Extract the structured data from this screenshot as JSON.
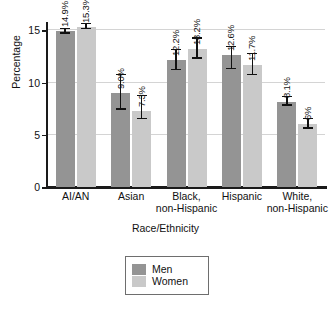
{
  "chart_data": {
    "type": "bar",
    "title": "",
    "xlabel": "Race/Ethnicity",
    "ylabel": "Percentage",
    "ylim": [
      0,
      15.8
    ],
    "yticks": [
      0,
      5,
      10,
      15
    ],
    "ytick_labels": [
      "0",
      "5",
      "10",
      "15"
    ],
    "grid": true,
    "grid_values": [
      5,
      10,
      15
    ],
    "legend_position": "bottom-center",
    "categories": [
      "AI/AN",
      "Asian",
      "Black, non-Hispanic",
      "Hispanic",
      "White, non-Hispanic"
    ],
    "category_lines": [
      [
        "AI/AN"
      ],
      [
        "Asian"
      ],
      [
        "Black,",
        "non-Hispanic"
      ],
      [
        "Hispanic"
      ],
      [
        "White,",
        "non-Hispanic"
      ]
    ],
    "series": [
      {
        "name": "Men",
        "color": "#949494",
        "values": [
          14.9,
          9.0,
          12.2,
          12.6,
          8.1
        ],
        "labels": [
          "14.9%",
          "9.0%",
          "12.2%",
          "12.6%",
          "8.1%"
        ],
        "err_low": [
          14.7,
          7.4,
          11.2,
          11.3,
          7.8
        ],
        "err_high": [
          15.1,
          10.7,
          13.1,
          13.4,
          8.6
        ]
      },
      {
        "name": "Women",
        "color": "#c9c9c9",
        "values": [
          15.3,
          7.3,
          13.2,
          11.7,
          6.0
        ],
        "labels": [
          "15.3%",
          "7.3%",
          "13.2%",
          "11.7%",
          "6%"
        ],
        "err_low": [
          15.1,
          6.5,
          12.3,
          10.7,
          5.6
        ],
        "err_high": [
          15.6,
          8.7,
          14.2,
          12.7,
          6.5
        ]
      }
    ]
  },
  "legend": {
    "items": [
      {
        "label": "Men"
      },
      {
        "label": "Women"
      }
    ]
  }
}
